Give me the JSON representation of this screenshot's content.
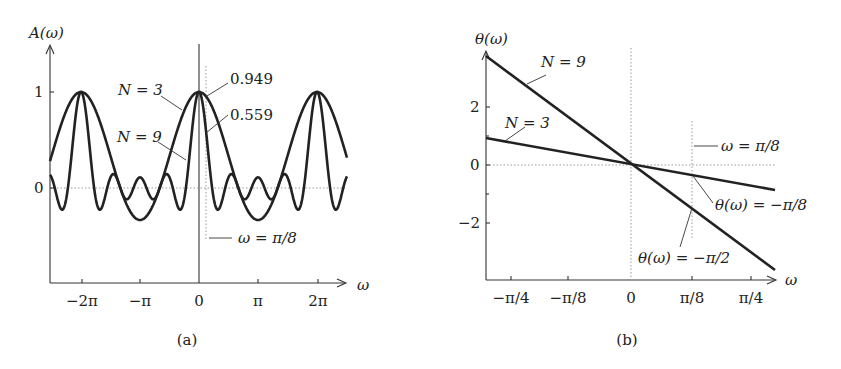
{
  "chart_data": [
    {
      "panel": "(a)",
      "type": "line",
      "title": "",
      "xlabel": "ω",
      "ylabel": "A(ω)",
      "x_ticks": [
        "−2π",
        "−π",
        "0",
        "π",
        "2π"
      ],
      "y_ticks": [
        "0",
        "1"
      ],
      "xlim": [
        -8.6,
        8.6
      ],
      "ylim": [
        -2.0,
        1.5
      ],
      "grid": false,
      "series": [
        {
          "name": "N = 3",
          "formula": "sin(3ω/2)/(3 sin(ω/2))",
          "peak": 1,
          "min": -0.333
        },
        {
          "name": "N = 9",
          "formula": "sin(9ω/2)/(9 sin(ω/2))",
          "peak": 1,
          "min": -0.23
        }
      ],
      "annotations": [
        {
          "text": "N = 3"
        },
        {
          "text": "N = 9"
        },
        {
          "text": "0.949",
          "x": "π/8",
          "series": "N = 3"
        },
        {
          "text": "0.559",
          "x": "π/8",
          "series": "N = 9"
        },
        {
          "text": "ω = π/8"
        }
      ]
    },
    {
      "panel": "(b)",
      "type": "line",
      "title": "",
      "xlabel": "ω",
      "ylabel": "θ(ω)",
      "x_ticks": [
        "−π/4",
        "−π/8",
        "0",
        "π/8",
        "π/4"
      ],
      "y_ticks": [
        "−2",
        "0",
        "2"
      ],
      "xlim": [
        -0.88,
        0.9
      ],
      "ylim": [
        -3.9,
        4.0
      ],
      "grid": false,
      "series": [
        {
          "name": "N = 3",
          "formula": "−ω",
          "x": [
            -0.85,
            0.85
          ],
          "y": [
            0.85,
            -0.85
          ]
        },
        {
          "name": "N = 9",
          "formula": "−4ω",
          "x": [
            -0.85,
            0.85
          ],
          "y": [
            3.4,
            -3.4
          ]
        }
      ],
      "annotations": [
        {
          "text": "N = 9"
        },
        {
          "text": "N = 3"
        },
        {
          "text": "ω = π/8"
        },
        {
          "text": "θ(ω) = −π/8",
          "x": "π/8",
          "series": "N = 3"
        },
        {
          "text": "θ(ω) = −π/2",
          "x": "π/8",
          "series": "N = 9"
        }
      ]
    }
  ],
  "figure": {
    "a": {
      "ylabel": "A(ω)",
      "xlabel": "ω",
      "yt1": "1",
      "yt0": "0",
      "xt": [
        "−2π",
        "−π",
        "0",
        "π",
        "2π"
      ],
      "n3": "N = 3",
      "n9": "N = 9",
      "v949": "0.949",
      "v559": "0.559",
      "wline": "ω = π/8",
      "caption": "(a)"
    },
    "b": {
      "ylabel": "θ(ω)",
      "xlabel": "ω",
      "yt": [
        "2",
        "0",
        "−2"
      ],
      "xt": [
        "−π/4",
        "−π/8",
        "0",
        "π/8",
        "π/4"
      ],
      "n9": "N = 9",
      "n3": "N = 3",
      "wline": "ω = π/8",
      "th8": "θ(ω) = −π/8",
      "th2": "θ(ω) = −π/2",
      "caption": "(b)"
    }
  }
}
